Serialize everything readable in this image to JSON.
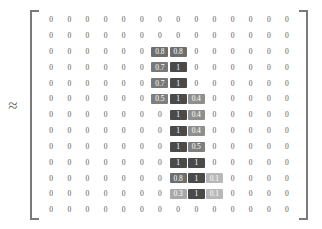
{
  "figure": {
    "relation_symbol": "≈",
    "bracket_left": "[",
    "bracket_right": "]"
  },
  "chart_data": {
    "type": "heatmap",
    "title": "",
    "xlabel": "",
    "ylabel": "",
    "rows": 13,
    "cols": 14,
    "grid_on": false,
    "legend": "none",
    "zlim": [
      0,
      1
    ],
    "colors": {
      "zero_text": "#555555",
      "level_0_1": "#b8b8b8",
      "level_0_3": "#a8a8a8",
      "level_0_4": "#8f8f8f",
      "level_0_5": "#7f7f7f",
      "level_0_7": "#787878",
      "level_0_8": "#6e6e6e",
      "level_1": "#4a4a4a",
      "cell_text": "#ffffff"
    },
    "cell_labels": [
      [
        "0",
        "0",
        "0",
        "0",
        "0",
        "0",
        "0",
        "0",
        "0",
        "0",
        "0",
        "0",
        "0",
        "0"
      ],
      [
        "0",
        "0",
        "0",
        "0",
        "0",
        "0",
        "0",
        "0",
        "0",
        "0",
        "0",
        "0",
        "0",
        "0"
      ],
      [
        "0",
        "0",
        "0",
        "0",
        "0",
        "0",
        "0.8",
        "0.8",
        "0",
        "0",
        "0",
        "0",
        "0",
        "0"
      ],
      [
        "0",
        "0",
        "0",
        "0",
        "0",
        "0",
        "0.7",
        "1",
        "0",
        "0",
        "0",
        "0",
        "0",
        "0"
      ],
      [
        "0",
        "0",
        "0",
        "0",
        "0",
        "0",
        "0.7",
        "1",
        "0",
        "0",
        "0",
        "0",
        "0",
        "0"
      ],
      [
        "0",
        "0",
        "0",
        "0",
        "0",
        "0",
        "0.5",
        "1",
        "0.4",
        "0",
        "0",
        "0",
        "0",
        "0"
      ],
      [
        "0",
        "0",
        "0",
        "0",
        "0",
        "0",
        "0",
        "1",
        "0.4",
        "0",
        "0",
        "0",
        "0",
        "0"
      ],
      [
        "0",
        "0",
        "0",
        "0",
        "0",
        "0",
        "0",
        "1",
        "0.4",
        "0",
        "0",
        "0",
        "0",
        "0"
      ],
      [
        "0",
        "0",
        "0",
        "0",
        "0",
        "0",
        "0",
        "1",
        "0.5",
        "0",
        "0",
        "0",
        "0",
        "0"
      ],
      [
        "0",
        "0",
        "0",
        "0",
        "0",
        "0",
        "0",
        "1",
        "1",
        "0",
        "0",
        "0",
        "0",
        "0"
      ],
      [
        "0",
        "0",
        "0",
        "0",
        "0",
        "0",
        "0",
        "0.8",
        "1",
        "0.1",
        "0",
        "0",
        "0",
        "0"
      ],
      [
        "0",
        "0",
        "0",
        "0",
        "0",
        "0",
        "0",
        "0.3",
        "1",
        "0.1",
        "0",
        "0",
        "0",
        "0"
      ],
      [
        "0",
        "0",
        "0",
        "0",
        "0",
        "0",
        "0",
        "0",
        "0",
        "0",
        "0",
        "0",
        "0",
        "0"
      ]
    ],
    "values": [
      [
        0,
        0,
        0,
        0,
        0,
        0,
        0,
        0,
        0,
        0,
        0,
        0,
        0,
        0
      ],
      [
        0,
        0,
        0,
        0,
        0,
        0,
        0,
        0,
        0,
        0,
        0,
        0,
        0,
        0
      ],
      [
        0,
        0,
        0,
        0,
        0,
        0,
        0.8,
        0.8,
        0,
        0,
        0,
        0,
        0,
        0
      ],
      [
        0,
        0,
        0,
        0,
        0,
        0,
        0.7,
        1,
        0,
        0,
        0,
        0,
        0,
        0
      ],
      [
        0,
        0,
        0,
        0,
        0,
        0,
        0.7,
        1,
        0,
        0,
        0,
        0,
        0,
        0
      ],
      [
        0,
        0,
        0,
        0,
        0,
        0,
        0.5,
        1,
        0.4,
        0,
        0,
        0,
        0,
        0
      ],
      [
        0,
        0,
        0,
        0,
        0,
        0,
        0,
        1,
        0.4,
        0,
        0,
        0,
        0,
        0
      ],
      [
        0,
        0,
        0,
        0,
        0,
        0,
        0,
        1,
        0.4,
        0,
        0,
        0,
        0,
        0
      ],
      [
        0,
        0,
        0,
        0,
        0,
        0,
        0,
        1,
        0.5,
        0,
        0,
        0,
        0,
        0
      ],
      [
        0,
        0,
        0,
        0,
        0,
        0,
        0,
        1,
        1,
        0,
        0,
        0,
        0,
        0
      ],
      [
        0,
        0,
        0,
        0,
        0,
        0,
        0,
        0.8,
        1,
        0.1,
        0,
        0,
        0,
        0
      ],
      [
        0,
        0,
        0,
        0,
        0,
        0,
        0,
        0.3,
        1,
        0.1,
        0,
        0,
        0,
        0
      ],
      [
        0,
        0,
        0,
        0,
        0,
        0,
        0,
        0,
        0,
        0,
        0,
        0,
        0,
        0
      ]
    ]
  }
}
